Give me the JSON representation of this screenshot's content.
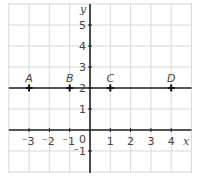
{
  "chart_data": {
    "type": "scatter",
    "title": "",
    "xlabel": "x",
    "ylabel": "y",
    "xlim": [
      -4,
      5
    ],
    "ylim": [
      -2,
      6
    ],
    "grid": true,
    "x_ticks": [
      "-3",
      "-2",
      "-1",
      "1",
      "2",
      "3",
      "4"
    ],
    "y_ticks": [
      "5",
      "4",
      "3",
      "2",
      "1",
      "-1"
    ],
    "origin_label": "0",
    "points": [
      {
        "label": "A",
        "x": -3,
        "y": 2
      },
      {
        "label": "B",
        "x": -1,
        "y": 2
      },
      {
        "label": "C",
        "x": 1,
        "y": 2
      },
      {
        "label": "D",
        "x": 4,
        "y": 2
      }
    ],
    "lines": [
      {
        "type": "horizontal",
        "y": 2,
        "description": "line through A, B, C, D"
      }
    ],
    "colors": {
      "grid": "#d9d9d9",
      "axis": "#222222",
      "line": "#222222",
      "text": "#444444"
    }
  }
}
